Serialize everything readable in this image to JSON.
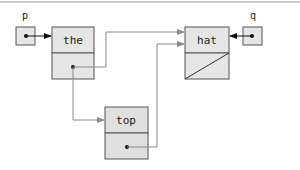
{
  "diagram": {
    "type": "linked-list-pointer-diagram",
    "pointers": [
      {
        "name": "p",
        "points_to": "the"
      },
      {
        "name": "q",
        "points_to": "hat"
      }
    ],
    "nodes": [
      {
        "id": "the",
        "value": "the",
        "next": "hat"
      },
      {
        "id": "top",
        "value": "top",
        "next": "hat"
      },
      {
        "id": "hat",
        "value": "hat",
        "next": null
      }
    ],
    "edges": [
      {
        "from": "p",
        "to": "the"
      },
      {
        "from": "q",
        "to": "hat"
      },
      {
        "from": "the.next",
        "to": "hat"
      },
      {
        "from": "the.next",
        "to": "top"
      },
      {
        "from": "top.next",
        "to": "hat"
      }
    ],
    "colors": {
      "node_fill": "#e6e6e6",
      "node_border": "#555555",
      "link_line": "#8a8a8a",
      "pointer_arrow": "#111111",
      "rule": "#999999"
    }
  }
}
